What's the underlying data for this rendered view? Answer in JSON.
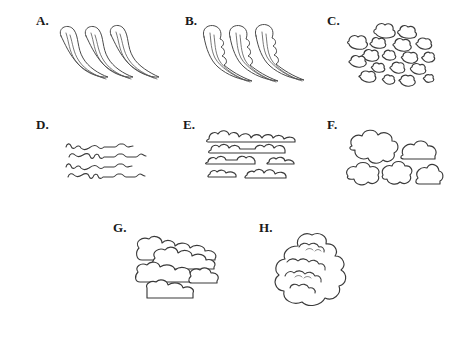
{
  "figure": {
    "width": 449,
    "height": 342,
    "background_color": "#ffffff",
    "line_color": "#3a3a3a",
    "label_color": "#1a1a1a"
  },
  "panels": [
    {
      "id": "a",
      "label": "A.",
      "label_x": 36,
      "label_y": 14,
      "art_x": 55,
      "art_y": 22,
      "art_w": 110,
      "art_h": 62,
      "icon_name": "cirrus-wisps-shape",
      "description": "three slender hooked wisps curving to the lower right",
      "element_count": 3
    },
    {
      "id": "b",
      "label": "B.",
      "label_x": 185,
      "label_y": 14,
      "art_x": 200,
      "art_y": 24,
      "art_w": 110,
      "art_h": 62,
      "icon_name": "cirrus-uncinus-tufted-shape",
      "description": "three tufted hooked plumes with rippled trailing edges",
      "element_count": 3
    },
    {
      "id": "c",
      "label": "C.",
      "label_x": 327,
      "label_y": 14,
      "art_x": 340,
      "art_y": 20,
      "art_w": 100,
      "art_h": 72,
      "icon_name": "cirrocumulus-granules-shape",
      "description": "scattered field of small rounded cloudlet granules",
      "element_count": 18
    },
    {
      "id": "d",
      "label": "D.",
      "label_x": 36,
      "label_y": 118,
      "art_x": 65,
      "art_y": 140,
      "art_w": 84,
      "art_h": 46,
      "icon_name": "cirrostratus-thin-wavy-lines-shape",
      "description": "four thin wavy horizontal filament lines",
      "element_count": 4
    },
    {
      "id": "e",
      "label": "E.",
      "label_x": 183,
      "label_y": 118,
      "art_x": 205,
      "art_y": 126,
      "art_w": 106,
      "art_h": 62,
      "icon_name": "altocumulus-bands-shape",
      "description": "four rows of flat-bottomed bumpy-topped cloud bands",
      "element_count": 6
    },
    {
      "id": "f",
      "label": "F.",
      "label_x": 327,
      "label_y": 118,
      "art_x": 342,
      "art_y": 128,
      "art_w": 98,
      "art_h": 66,
      "icon_name": "cumulus-humilis-group-shape",
      "description": "five separate puffy rounded clouds, two above and three below",
      "element_count": 5
    },
    {
      "id": "g",
      "label": "G.",
      "label_x": 113,
      "label_y": 221,
      "art_x": 133,
      "art_y": 236,
      "art_w": 96,
      "art_h": 72,
      "icon_name": "stratocumulus-layered-decks-shape",
      "description": "four overlapping horizontal lumpy cloud decks stacked in layers",
      "element_count": 4
    },
    {
      "id": "h",
      "label": "H.",
      "label_x": 259,
      "label_y": 221,
      "art_x": 268,
      "art_y": 230,
      "art_w": 86,
      "art_h": 82,
      "icon_name": "cumulonimbus-tower-shape",
      "description": "one tall billowing towering cloud mass with stacked lobes",
      "element_count": 1
    }
  ]
}
